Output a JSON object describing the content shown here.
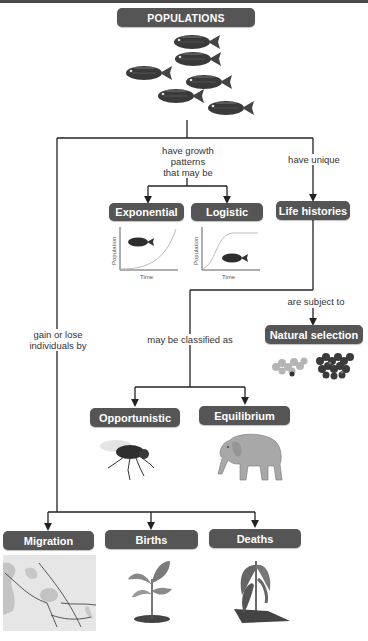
{
  "diagram": {
    "root": {
      "label": "POPULATIONS"
    },
    "links": {
      "growth": "have growth\npatterns\nthat may be",
      "unique": "have unique",
      "gain_lose": "gain or lose\nindividuals by",
      "classified": "may be classified as",
      "subject": "are subject to"
    },
    "nodes": {
      "exponential": "Exponential",
      "logistic": "Logistic",
      "life_histories": "Life histories",
      "natural_selection": "Natural selection",
      "opportunistic": "Opportunistic",
      "equilibrium": "Equilibrium",
      "migration": "Migration",
      "births": "Births",
      "deaths": "Deaths"
    },
    "graphs": {
      "exponential": {
        "ylabel": "Population",
        "xlabel": "Time"
      },
      "logistic": {
        "ylabel": "Population",
        "xlabel": "Time"
      }
    },
    "images": {
      "fish_school": "fish-school",
      "fly": "fly",
      "elephant": "elephant",
      "beetles": "beetles",
      "migration_map": "migration-map",
      "seedling": "seedling",
      "wilted_plant": "wilted-plant"
    },
    "colors": {
      "node_bg": "#555555",
      "node_text": "#ffffff",
      "line": "#222222"
    }
  }
}
